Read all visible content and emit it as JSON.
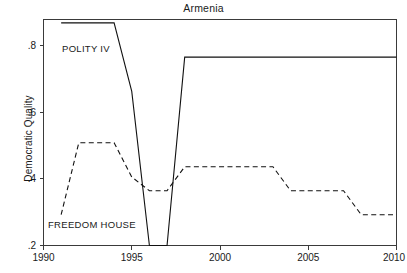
{
  "chart_data": {
    "type": "line",
    "title": "Armenia",
    "xlabel": "",
    "ylabel": "Democratic Quality",
    "xlim": [
      1990,
      2010
    ],
    "ylim": [
      0.2,
      0.86
    ],
    "grid": false,
    "legend_position": "inline-annotation",
    "xticks": [
      1990,
      1995,
      2000,
      2005,
      2010
    ],
    "xtick_labels": [
      "1990",
      "1995",
      "2000",
      "2005",
      "2010"
    ],
    "yticks": [
      0.2,
      0.4,
      0.6,
      0.8
    ],
    "ytick_labels": [
      ".2",
      ".4",
      ".6",
      ".8"
    ],
    "series": [
      {
        "name": "POLITY IV",
        "style": "solid",
        "color": "#111111",
        "annotation": "POLITY IV",
        "x": [
          1991,
          1992,
          1993,
          1994,
          1995,
          1996,
          1997,
          1998,
          1999,
          2000,
          2001,
          2002,
          2003,
          2004,
          2005,
          2006,
          2007,
          2008,
          2009,
          2010
        ],
        "values": [
          0.85,
          0.85,
          0.85,
          0.85,
          0.65,
          0.2,
          0.2,
          0.75,
          0.75,
          0.75,
          0.75,
          0.75,
          0.75,
          0.75,
          0.75,
          0.75,
          0.75,
          0.75,
          0.75,
          0.75
        ]
      },
      {
        "name": "FREEDOM HOUSE",
        "style": "dashed",
        "color": "#111111",
        "annotation": "FREEDOM HOUSE",
        "x": [
          1991,
          1992,
          1993,
          1994,
          1995,
          1996,
          1997,
          1998,
          1999,
          2000,
          2001,
          2002,
          2003,
          2004,
          2005,
          2006,
          2007,
          2008,
          2009,
          2010
        ],
        "values": [
          0.29,
          0.5,
          0.5,
          0.5,
          0.4,
          0.36,
          0.36,
          0.43,
          0.43,
          0.43,
          0.43,
          0.43,
          0.43,
          0.36,
          0.36,
          0.36,
          0.36,
          0.29,
          0.29,
          0.29
        ]
      }
    ]
  },
  "labels": {
    "title": "Armenia",
    "ylabel": "Democratic Quality",
    "polity_annotation": "POLITY IV",
    "freedom_house_annotation": "FREEDOM HOUSE",
    "xtick_1990": "1990",
    "xtick_1995": "1995",
    "xtick_2000": "2000",
    "xtick_2005": "2005",
    "xtick_2010": "2010",
    "ytick_02": ".2",
    "ytick_04": ".4",
    "ytick_06": ".6",
    "ytick_08": ".8"
  }
}
